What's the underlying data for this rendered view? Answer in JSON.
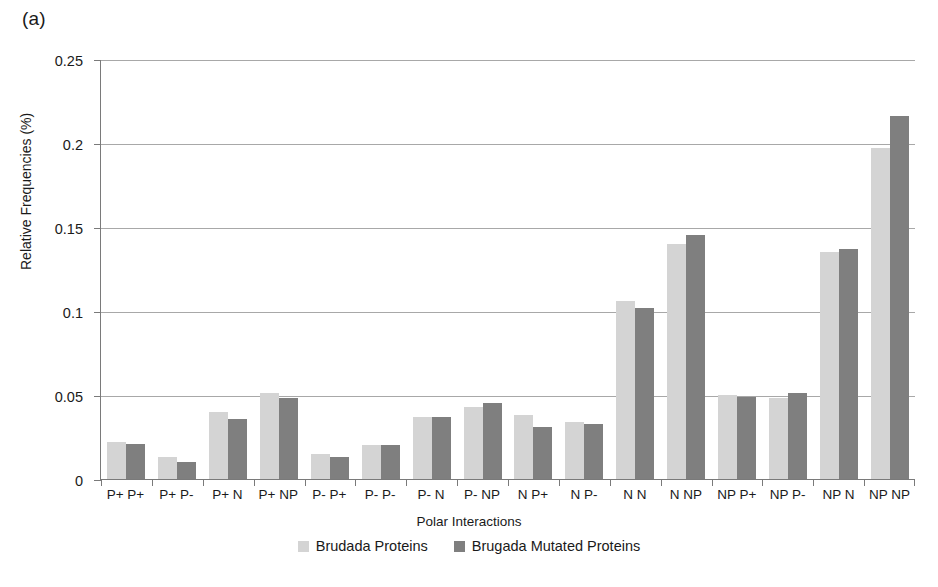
{
  "panel": {
    "label": "(a)"
  },
  "chart_data": {
    "type": "bar",
    "title": "",
    "xlabel": "Polar Interactions",
    "ylabel": "Relative Frequencies (%)",
    "ylim": [
      0,
      0.25
    ],
    "ytick_labels": [
      "0.25",
      "0.2",
      "0.15",
      "0.1",
      "0.05",
      "0"
    ],
    "ytick_values": [
      0.25,
      0.2,
      0.15,
      0.1,
      0.05,
      0
    ],
    "grid": "horizontal",
    "legend_position": "bottom-center",
    "categories": [
      "P+ P+",
      "P+ P-",
      "P+ N",
      "P+ NP",
      "P- P+",
      "P- P-",
      "P- N",
      "P- NP",
      "N P+",
      "N P-",
      "N N",
      "N NP",
      "NP P+",
      "NP P-",
      "NP N",
      "NP NP"
    ],
    "series": [
      {
        "name": "Brudada Proteins",
        "color": "#d4d4d4",
        "values": [
          0.022,
          0.013,
          0.04,
          0.051,
          0.015,
          0.02,
          0.037,
          0.043,
          0.038,
          0.034,
          0.106,
          0.14,
          0.05,
          0.048,
          0.135,
          0.197
        ]
      },
      {
        "name": "Brugada Mutated Proteins",
        "color": "#7f7f7f",
        "values": [
          0.021,
          0.01,
          0.036,
          0.048,
          0.013,
          0.02,
          0.037,
          0.045,
          0.031,
          0.033,
          0.102,
          0.145,
          0.049,
          0.051,
          0.137,
          0.216
        ]
      }
    ]
  }
}
